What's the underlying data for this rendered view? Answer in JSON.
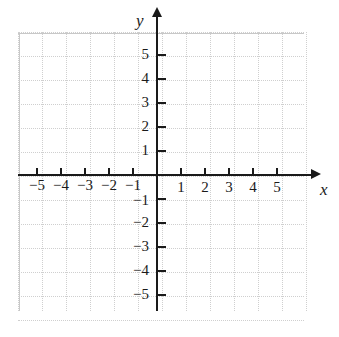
{
  "chart_data": {
    "type": "scatter",
    "title": "",
    "subtitle": "",
    "xlabel": "x",
    "ylabel": "y",
    "xlim": [
      -6,
      6
    ],
    "ylim": [
      -6,
      6
    ],
    "xticks": [
      -5,
      -4,
      -3,
      -2,
      -1,
      1,
      2,
      3,
      4,
      5
    ],
    "yticks": [
      5,
      4,
      3,
      2,
      1,
      -1,
      -2,
      -3,
      -4,
      -5
    ],
    "xtick_labels": [
      "−5",
      "−4",
      "−3",
      "−2",
      "−1",
      "1",
      "2",
      "3",
      "4",
      "5"
    ],
    "ytick_labels": [
      "5",
      "4",
      "3",
      "2",
      "1",
      "−1",
      "−2",
      "−3",
      "−4",
      "−5"
    ],
    "grid": true,
    "grid_style": "dotted",
    "grid_spacing_units": 1,
    "legend": null,
    "series": [],
    "values": [],
    "annotations": [],
    "axis_arrows": [
      "x-positive",
      "y-positive"
    ],
    "colors": {
      "axis": "#1a1a1a",
      "grid": "#c2c2c2",
      "background": "#ffffff",
      "text": "#1a1a1a"
    }
  },
  "axes": {
    "x_name": "x",
    "y_name": "y",
    "x_negative_labels": [
      {
        "value": -5,
        "text": "−5"
      },
      {
        "value": -4,
        "text": "−4"
      },
      {
        "value": -3,
        "text": "−3"
      },
      {
        "value": -2,
        "text": "−2"
      },
      {
        "value": -1,
        "text": "−1"
      }
    ],
    "x_positive_labels": [
      {
        "value": 1,
        "text": "1"
      },
      {
        "value": 2,
        "text": "2"
      },
      {
        "value": 3,
        "text": "3"
      },
      {
        "value": 4,
        "text": "4"
      },
      {
        "value": 5,
        "text": "5"
      }
    ],
    "y_positive_labels": [
      {
        "value": 5,
        "text": "5"
      },
      {
        "value": 4,
        "text": "4"
      },
      {
        "value": 3,
        "text": "3"
      },
      {
        "value": 2,
        "text": "2"
      },
      {
        "value": 1,
        "text": "1"
      }
    ],
    "y_negative_labels": [
      {
        "value": -1,
        "text": "−1"
      },
      {
        "value": -2,
        "text": "−2"
      },
      {
        "value": -3,
        "text": "−3"
      },
      {
        "value": -4,
        "text": "−4"
      },
      {
        "value": -5,
        "text": "−5"
      }
    ]
  },
  "geometry": {
    "origin_x": 157,
    "origin_y": 175,
    "unit_px": 24,
    "grid_left": 18,
    "grid_top": 32,
    "grid_width": 286,
    "grid_height": 279
  }
}
